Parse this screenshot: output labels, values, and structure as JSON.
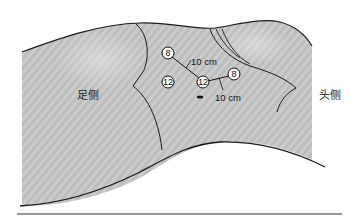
{
  "figure": {
    "type": "laparoscopic port placement diagram",
    "labels": {
      "foot_side": "足侧",
      "head_side": "头侧"
    },
    "colors": {
      "body_fill": "#c9c9c9",
      "stripe": "#b8b8b8",
      "outline": "#1a1a1a",
      "port_fill": "#ffffff"
    },
    "ports": [
      {
        "id": "port-1",
        "size": "8",
        "x": 168,
        "y": 53
      },
      {
        "id": "port-2",
        "size": "12",
        "x": 168,
        "y": 82
      },
      {
        "id": "port-3",
        "size": "12",
        "x": 203,
        "y": 82
      },
      {
        "id": "port-4",
        "size": "8",
        "x": 234,
        "y": 74
      }
    ],
    "distances": [
      {
        "id": "dist-1",
        "text": "10 cm",
        "x": 192,
        "y": 62
      },
      {
        "id": "dist-2",
        "text": "10 cm",
        "x": 215,
        "y": 100
      }
    ],
    "navel_marker": {
      "x": 200,
      "y": 97
    }
  }
}
